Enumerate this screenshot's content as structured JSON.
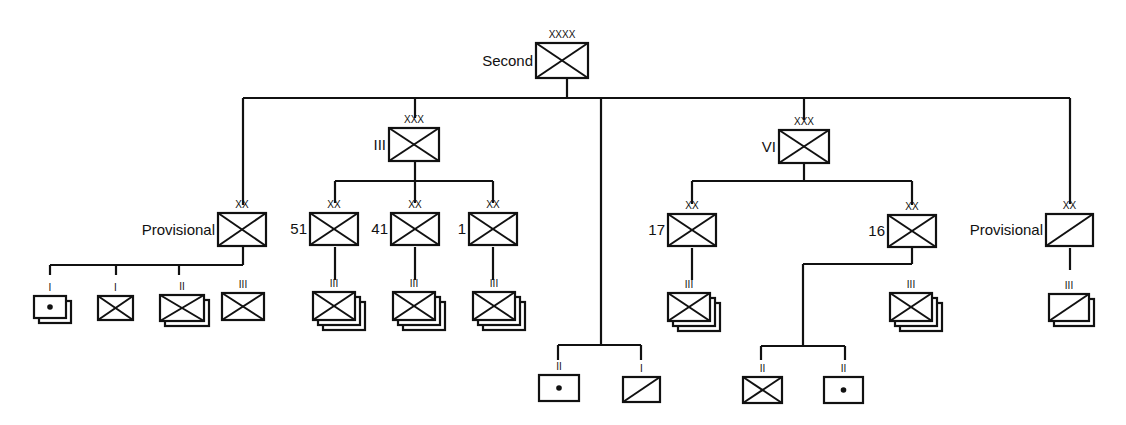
{
  "diagram": {
    "colors": {
      "line": "#111111",
      "background": "#ffffff"
    },
    "nodes": [
      {
        "id": "second",
        "label": "Second",
        "echelon": "XXXX",
        "type": "infantry",
        "x": 536,
        "y": 43,
        "w": 52,
        "h": 35,
        "stack": 0
      },
      {
        "id": "prov-l",
        "label": "Provisional",
        "echelon": "XX",
        "type": "infantry",
        "x": 218,
        "y": 213,
        "w": 48,
        "h": 33,
        "stack": 0
      },
      {
        "id": "iii-corps",
        "label": "III",
        "echelon": "XXX",
        "type": "infantry",
        "x": 389,
        "y": 128,
        "w": 50,
        "h": 33,
        "stack": 0
      },
      {
        "id": "div-51",
        "label": "51",
        "echelon": "XX",
        "type": "infantry",
        "x": 310,
        "y": 213,
        "w": 48,
        "h": 32,
        "stack": 0
      },
      {
        "id": "div-41",
        "label": "41",
        "echelon": "XX",
        "type": "infantry",
        "x": 391,
        "y": 213,
        "w": 48,
        "h": 32,
        "stack": 0
      },
      {
        "id": "div-1",
        "label": "1",
        "echelon": "XX",
        "type": "infantry",
        "x": 469,
        "y": 213,
        "w": 48,
        "h": 32,
        "stack": 0
      },
      {
        "id": "vi-corps",
        "label": "VI",
        "echelon": "XXX",
        "type": "infantry",
        "x": 779,
        "y": 130,
        "w": 50,
        "h": 33,
        "stack": 0
      },
      {
        "id": "div-17",
        "label": "17",
        "echelon": "XX",
        "type": "infantry",
        "x": 668,
        "y": 214,
        "w": 48,
        "h": 32,
        "stack": 0
      },
      {
        "id": "div-16",
        "label": "16",
        "echelon": "XX",
        "type": "infantry",
        "x": 888,
        "y": 215,
        "w": 48,
        "h": 32,
        "stack": 0
      },
      {
        "id": "prov-r",
        "label": "Provisional",
        "echelon": "XX",
        "type": "cavalry",
        "x": 1046,
        "y": 214,
        "w": 47,
        "h": 32,
        "stack": 0
      },
      {
        "id": "pl-arty",
        "label": "",
        "echelon": "I",
        "type": "artillery",
        "x": 34,
        "y": 296,
        "w": 32,
        "h": 22,
        "stack": 1
      },
      {
        "id": "pl-inf",
        "label": "",
        "echelon": "I",
        "type": "infantry",
        "x": 98,
        "y": 296,
        "w": 35,
        "h": 24,
        "stack": 0
      },
      {
        "id": "bn-inf-l",
        "label": "",
        "echelon": "II",
        "type": "infantry",
        "x": 160,
        "y": 295,
        "w": 44,
        "h": 26,
        "stack": 1
      },
      {
        "id": "rgt-inf-l",
        "label": "",
        "echelon": "III",
        "type": "infantry",
        "x": 222,
        "y": 293,
        "w": 42,
        "h": 27,
        "stack": 0
      },
      {
        "id": "rgt-51",
        "label": "",
        "echelon": "III",
        "type": "infantry",
        "x": 313,
        "y": 292,
        "w": 42,
        "h": 28,
        "stack": 2
      },
      {
        "id": "rgt-41",
        "label": "",
        "echelon": "III",
        "type": "infantry",
        "x": 393,
        "y": 292,
        "w": 42,
        "h": 28,
        "stack": 2
      },
      {
        "id": "rgt-1",
        "label": "",
        "echelon": "III",
        "type": "infantry",
        "x": 473,
        "y": 292,
        "w": 42,
        "h": 28,
        "stack": 2
      },
      {
        "id": "rgt-17",
        "label": "",
        "echelon": "III",
        "type": "infantry",
        "x": 668,
        "y": 293,
        "w": 42,
        "h": 28,
        "stack": 2
      },
      {
        "id": "rgt-16",
        "label": "",
        "echelon": "III",
        "type": "infantry",
        "x": 890,
        "y": 293,
        "w": 42,
        "h": 28,
        "stack": 2
      },
      {
        "id": "rgt-cav-r",
        "label": "",
        "echelon": "III",
        "type": "cavalry",
        "x": 1049,
        "y": 294,
        "w": 40,
        "h": 27,
        "stack": 1
      },
      {
        "id": "bn-arty-c",
        "label": "",
        "echelon": "II",
        "type": "artillery",
        "x": 539,
        "y": 375,
        "w": 40,
        "h": 26,
        "stack": 0
      },
      {
        "id": "co-cav-c",
        "label": "",
        "echelon": "I",
        "type": "cavalry",
        "x": 623,
        "y": 377,
        "w": 37,
        "h": 25,
        "stack": 0
      },
      {
        "id": "bn-inf-vi",
        "label": "",
        "echelon": "II",
        "type": "infantry",
        "x": 743,
        "y": 377,
        "w": 39,
        "h": 26,
        "stack": 0
      },
      {
        "id": "bn-arty-vi",
        "label": "",
        "echelon": "II",
        "type": "artillery",
        "x": 824,
        "y": 377,
        "w": 39,
        "h": 26,
        "stack": 0
      }
    ],
    "lines": [
      [
        567,
        78,
        567,
        98
      ],
      [
        243,
        98,
        1070,
        98
      ],
      [
        243,
        98,
        243,
        205
      ],
      [
        415,
        98,
        415,
        118
      ],
      [
        601,
        98,
        601,
        345
      ],
      [
        804,
        98,
        804,
        120
      ],
      [
        1070,
        98,
        1070,
        204
      ],
      [
        415,
        162,
        415,
        181
      ],
      [
        335,
        181,
        493,
        181
      ],
      [
        335,
        181,
        335,
        203
      ],
      [
        415,
        181,
        415,
        203
      ],
      [
        493,
        181,
        493,
        203
      ],
      [
        804,
        163,
        804,
        181
      ],
      [
        692,
        181,
        912,
        181
      ],
      [
        692,
        181,
        692,
        204
      ],
      [
        912,
        181,
        912,
        205
      ],
      [
        243,
        247,
        243,
        265
      ],
      [
        50,
        265,
        243,
        265
      ],
      [
        50,
        265,
        50,
        275
      ],
      [
        116,
        265,
        116,
        275
      ],
      [
        179,
        265,
        179,
        275
      ],
      [
        335,
        247,
        335,
        280
      ],
      [
        415,
        247,
        415,
        280
      ],
      [
        493,
        247,
        493,
        280
      ],
      [
        692,
        248,
        692,
        280
      ],
      [
        912,
        248,
        912,
        264
      ],
      [
        803,
        264,
        912,
        264
      ],
      [
        803,
        264,
        803,
        346
      ],
      [
        761,
        346,
        845,
        346
      ],
      [
        761,
        346,
        761,
        360
      ],
      [
        845,
        346,
        845,
        360
      ],
      [
        1070,
        248,
        1070,
        270
      ],
      [
        558,
        345,
        641,
        345
      ],
      [
        558,
        345,
        558,
        360
      ],
      [
        641,
        345,
        641,
        360
      ]
    ]
  }
}
